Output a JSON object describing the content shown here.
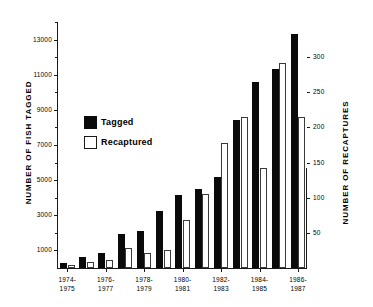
{
  "chart_data": {
    "type": "bar",
    "title": "",
    "subtitle": "",
    "xlabel": "",
    "ylabel": "NUMBER OF FISH TAGGED",
    "ylabel_right": "NUMBER OF RECAPTURES",
    "grid": false,
    "legend_position": "upper-left-inside",
    "ylim": [
      0,
      14000
    ],
    "ylim_right": [
      0,
      350
    ],
    "yticks": [
      1000,
      3000,
      5000,
      7000,
      9000,
      11000,
      13000
    ],
    "yticklabels": [
      "1000",
      "3000",
      "5000",
      "7000",
      "9000",
      "11000",
      "13000"
    ],
    "yticks_right": [
      50,
      100,
      150,
      200,
      250,
      300
    ],
    "yticklabels_right": [
      "50",
      "100",
      "150",
      "200",
      "250",
      "300"
    ],
    "categories": [
      "1974-1975",
      "1975-1976",
      "1976-1977",
      "1977-1978",
      "1978-1979",
      "1979-1980",
      "1980-1981",
      "1981-1982",
      "1982-1983",
      "1983-1984",
      "1984-1985",
      "1985-1986",
      "1986-1987"
    ],
    "xticklabels_shown": [
      "1974-\n1975",
      "1976-\n1977",
      "1978-\n1979",
      "1980-\n1981",
      "1982-\n1983",
      "1984-\n1985",
      "1986-\n1987"
    ],
    "series": [
      {
        "name": "Tagged",
        "axis": "left",
        "color": "#0a0a0a",
        "values": [
          300,
          600,
          850,
          1950,
          2100,
          3250,
          4150,
          4500,
          5200,
          8450,
          10600,
          11350,
          13300
        ]
      },
      {
        "name": "Recaptured",
        "axis": "right",
        "color": "#ffffff",
        "values": [
          5,
          8,
          12,
          28,
          22,
          25,
          68,
          105,
          178,
          215,
          142,
          292,
          215
        ]
      }
    ]
  },
  "legend": {
    "items": [
      {
        "label": "Tagged",
        "swatch": "filled-black-square"
      },
      {
        "label": "Recaptured",
        "swatch": "outlined-white-square"
      }
    ]
  },
  "axes": {
    "left_title": "NUMBER OF FISH TAGGED",
    "right_title": "NUMBER OF RECAPTURES"
  }
}
